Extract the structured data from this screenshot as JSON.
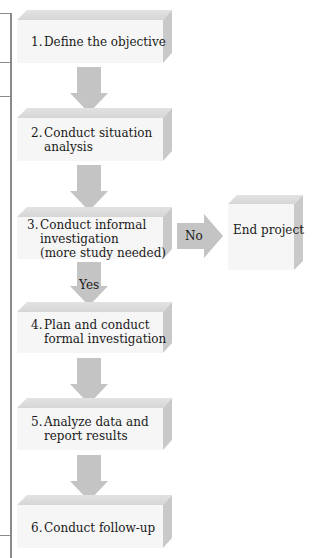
{
  "diagram": {
    "type": "flowchart",
    "colors": {
      "arrow": "#c4c4c4",
      "box_front": "#f6f6f6",
      "box_top": "#dcdcdc",
      "box_side": "#c9c9c9",
      "frame": "#8a8a8a"
    },
    "steps": [
      {
        "number": "1.",
        "lines": [
          "Define the objective"
        ]
      },
      {
        "number": "2.",
        "lines": [
          "Conduct situation",
          "analysis"
        ]
      },
      {
        "number": "3.",
        "lines": [
          "Conduct informal",
          "investigation",
          "(more study needed)"
        ]
      },
      {
        "number": "4.",
        "lines": [
          "Plan and conduct",
          "formal investigation"
        ]
      },
      {
        "number": "5.",
        "lines": [
          "Analyze data and",
          "report results"
        ]
      },
      {
        "number": "6.",
        "lines": [
          "Conduct follow-up"
        ]
      }
    ],
    "branch": {
      "no_label": "No",
      "yes_label": "Yes",
      "end_box_label": "End project"
    }
  }
}
